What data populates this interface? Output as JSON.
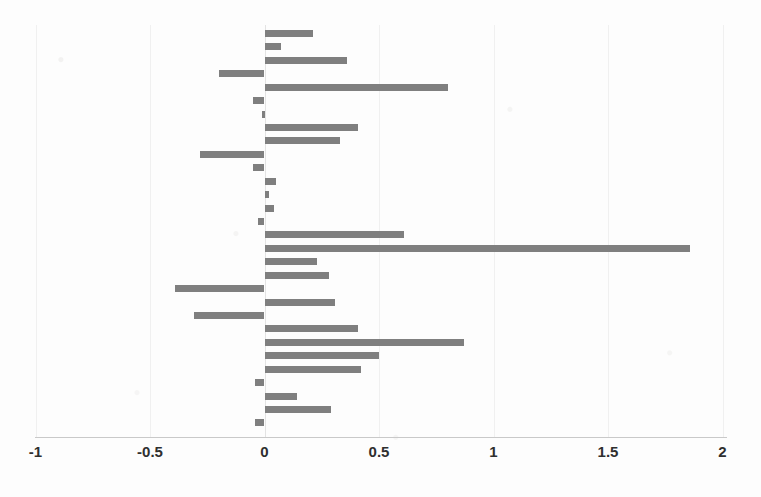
{
  "chart_data": {
    "type": "bar",
    "orientation": "horizontal",
    "title": "",
    "subtitle": "",
    "xlabel": "",
    "ylabel": "",
    "xlim": [
      -1,
      2
    ],
    "ylim": null,
    "grid": false,
    "legend": null,
    "legend_position": "none",
    "bar_color": "#7f7f7f",
    "axis_tick_labels": [
      "-1",
      "-0.5",
      "0",
      "0.5",
      "1",
      "1.5",
      "2"
    ],
    "axis_tick_values": [
      -1,
      -0.5,
      0,
      0.5,
      1,
      1.5,
      2
    ],
    "categories": [
      "1",
      "2",
      "3",
      "4",
      "5",
      "6",
      "7",
      "8",
      "9",
      "10",
      "11",
      "12",
      "13",
      "14",
      "15",
      "16",
      "17",
      "18",
      "19",
      "20",
      "21",
      "22",
      "23",
      "24",
      "25",
      "26",
      "27",
      "28",
      "29",
      "30"
    ],
    "values": [
      0.21,
      0.07,
      0.36,
      -0.2,
      0.8,
      -0.05,
      -0.01,
      0.41,
      0.33,
      -0.28,
      -0.05,
      0.05,
      0.02,
      0.04,
      -0.03,
      0.61,
      1.86,
      0.23,
      0.28,
      -0.39,
      0.31,
      -0.31,
      0.41,
      0.87,
      0.5,
      0.42,
      -0.04,
      0.14,
      0.29,
      -0.04
    ]
  },
  "axis": {
    "labels": [
      "-1",
      "-0.5",
      "0",
      "0.5",
      "1",
      "1.5",
      "2"
    ]
  }
}
